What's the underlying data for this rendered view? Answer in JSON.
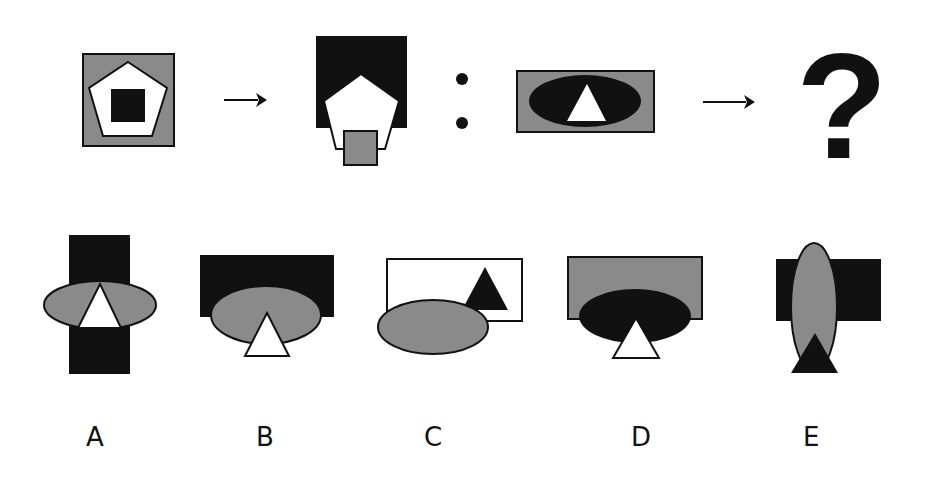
{
  "colors": {
    "black": "#111111",
    "gray": "#8a8a8a",
    "white": "#ffffff",
    "stroke": "#111111"
  },
  "puzzle": {
    "question_mark": "?",
    "separator": ":",
    "arrow": "→",
    "example_pair": {
      "source": {
        "outer": {
          "shape": "square",
          "fill": "gray"
        },
        "middle": {
          "shape": "pentagon",
          "fill": "white"
        },
        "inner": {
          "shape": "square",
          "fill": "black"
        }
      },
      "result": {
        "back": {
          "shape": "square",
          "fill": "black"
        },
        "middle": {
          "shape": "pentagon",
          "fill": "white",
          "position": "shifted down"
        },
        "front": {
          "shape": "square",
          "fill": "gray",
          "position": "bottom"
        }
      }
    },
    "query": {
      "outer": {
        "shape": "rectangle",
        "fill": "gray"
      },
      "middle": {
        "shape": "ellipse",
        "fill": "black"
      },
      "inner": {
        "shape": "triangle",
        "fill": "white"
      }
    }
  },
  "options": [
    {
      "label": "A",
      "rect": "black (vertical)",
      "ellipse": "gray (horizontal)",
      "triangle": "white"
    },
    {
      "label": "B",
      "rect": "black",
      "ellipse": "gray",
      "triangle": "white"
    },
    {
      "label": "C",
      "rect": "white",
      "ellipse": "gray",
      "triangle": "black"
    },
    {
      "label": "D",
      "rect": "gray",
      "ellipse": "black",
      "triangle": "white"
    },
    {
      "label": "E",
      "rect": "black",
      "ellipse": "gray (vertical)",
      "triangle": "black"
    }
  ]
}
